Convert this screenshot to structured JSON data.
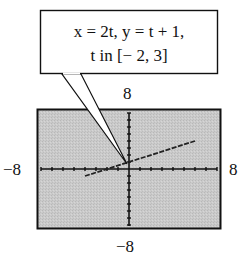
{
  "callout": {
    "line1": "x = 2t,  y = t + 1,",
    "line2": "t in [− 2, 3]"
  },
  "window": {
    "ymax_label": "8",
    "ymin_label": "−8",
    "xmin_label": "−8",
    "xmax_label": "8"
  },
  "colors": {
    "screen_bg": "#c9c9c9",
    "axis": "#111111",
    "curve": "#222222"
  },
  "chart_data": {
    "type": "line",
    "xlabel": "",
    "ylabel": "",
    "xlim": [
      -8,
      8
    ],
    "ylim": [
      -8,
      8
    ],
    "grid": false,
    "x_tick_step": 1,
    "y_tick_step": 1,
    "parametric": {
      "x": "2t",
      "y": "t + 1",
      "t_range": [
        -2,
        3
      ]
    },
    "series": [
      {
        "name": "x = 2t, y = t + 1",
        "x": [
          -4,
          -2,
          0,
          2,
          4,
          6
        ],
        "y": [
          -1,
          0,
          1,
          2,
          3,
          4
        ]
      }
    ],
    "annotations": [
      "x = 2t,  y = t + 1,  t in [− 2, 3]"
    ]
  }
}
